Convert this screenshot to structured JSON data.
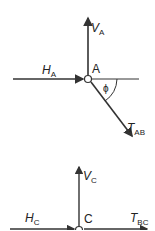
{
  "diagram": {
    "joint_a": {
      "label": "A",
      "forces": {
        "vertical": {
          "symbol": "V",
          "subscript": "A"
        },
        "horizontal": {
          "symbol": "H",
          "subscript": "A"
        },
        "tension": {
          "symbol": "T",
          "subscript": "AB"
        }
      },
      "angle_label": "ϕ"
    },
    "joint_c": {
      "label": "C",
      "forces": {
        "vertical": {
          "symbol": "V",
          "subscript": "C"
        },
        "horizontal": {
          "symbol": "H",
          "subscript": "C"
        },
        "tension": {
          "symbol": "T",
          "subscript": "BC"
        }
      }
    },
    "colors": {
      "line": "#333333",
      "text": "#222222"
    }
  }
}
